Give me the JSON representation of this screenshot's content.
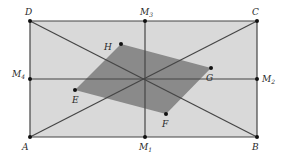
{
  "diagram": {
    "colors": {
      "rect_fill": "#d9d9d9",
      "inner_fill": "#8a8a8a",
      "stroke": "#454545",
      "point": "#111111",
      "background": "#ffffff"
    },
    "points": {
      "A": {
        "x": 30,
        "y": 137,
        "label": "A",
        "lx": 22,
        "ly": 150
      },
      "B": {
        "x": 257,
        "y": 137,
        "label": "B",
        "lx": 252,
        "ly": 150
      },
      "C": {
        "x": 257,
        "y": 21,
        "label": "C",
        "lx": 252,
        "ly": 15
      },
      "D": {
        "x": 30,
        "y": 21,
        "label": "D",
        "lx": 25,
        "ly": 15
      },
      "M1": {
        "x": 145,
        "y": 137,
        "label": "M",
        "sub": "1",
        "lx": 139,
        "ly": 150
      },
      "M2": {
        "x": 257,
        "y": 79,
        "label": "M",
        "sub": "2",
        "lx": 262,
        "ly": 82
      },
      "M3": {
        "x": 145,
        "y": 21,
        "label": "M",
        "sub": "3",
        "lx": 140,
        "ly": 15
      },
      "M4": {
        "x": 30,
        "y": 79,
        "label": "M",
        "sub": "4",
        "lx": 12,
        "ly": 77
      },
      "E": {
        "x": 75,
        "y": 90,
        "label": "E",
        "lx": 72,
        "ly": 103
      },
      "F": {
        "x": 166,
        "y": 114,
        "label": "F",
        "lx": 162,
        "ly": 127
      },
      "G": {
        "x": 211,
        "y": 68,
        "label": "G",
        "lx": 206,
        "ly": 81
      },
      "H": {
        "x": 121,
        "y": 44,
        "label": "H",
        "lx": 104,
        "ly": 50
      }
    },
    "segments": [
      [
        "A",
        "C"
      ],
      [
        "M1",
        "M3"
      ],
      [
        "D",
        "B"
      ],
      [
        "M4",
        "M2"
      ]
    ],
    "rectangle": [
      "A",
      "B",
      "C",
      "D"
    ],
    "inner_parallelogram": [
      "E",
      "F",
      "G",
      "H"
    ]
  }
}
